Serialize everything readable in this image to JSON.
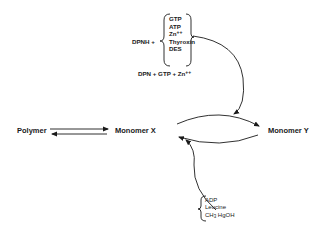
{
  "diagram": {
    "nodes": {
      "polymer": "Polymer",
      "monomer_x": "Monomer X",
      "monomer_y": "Monomer Y"
    },
    "activators": {
      "prefix": "DPNH +",
      "items": [
        "GTP",
        "ATP",
        "Zn",
        "Thyroxin",
        "DES"
      ],
      "zn_charge": "++",
      "alt_line_a": "DPN + GTP + Zn",
      "alt_line_charge": "++"
    },
    "reverse_effectors": {
      "items": [
        "ADP",
        "Leucine",
        "CH",
        "HgOH"
      ],
      "ch3_subscript": "3"
    },
    "edges": [
      {
        "from": "Polymer",
        "to": "Monomer X",
        "type": "reversible"
      },
      {
        "from": "Monomer X",
        "to": "Monomer Y",
        "type": "forward-curve"
      },
      {
        "from": "Monomer Y",
        "to": "Monomer X",
        "type": "reverse-curve"
      },
      {
        "from": "activators",
        "to": "X->Y arrow",
        "type": "modifier"
      },
      {
        "from": "reverse_effectors",
        "to": "Y->X arrow",
        "type": "modifier"
      }
    ]
  }
}
